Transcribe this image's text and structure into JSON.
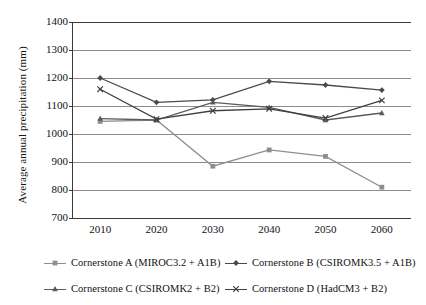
{
  "chart_data": {
    "type": "line",
    "title": "",
    "xlabel": "",
    "ylabel": "Average annual precipitation (mm)",
    "x": [
      2010,
      2020,
      2030,
      2040,
      2050,
      2060
    ],
    "categories": [
      "2010",
      "2020",
      "2030",
      "2040",
      "2050",
      "2060"
    ],
    "ylim": [
      700,
      1400
    ],
    "yticks": [
      700,
      800,
      900,
      1000,
      1100,
      1200,
      1300,
      1400
    ],
    "ytick_labels": [
      "700",
      "800",
      "900",
      "1000",
      "1100",
      "1200",
      "1300",
      "1400"
    ],
    "grid": true,
    "grid_axis": "y",
    "legend_position": "bottom",
    "legend_columns": 2,
    "series": [
      {
        "name": "Cornerstone A (MIROC3.2 + A1B)",
        "key": "A",
        "marker": "square",
        "color": "#8e8e8e",
        "values": [
          1045,
          1050,
          885,
          943,
          920,
          810
        ]
      },
      {
        "name": "Cornerstone B (CSIROMK3.5 + A1B)",
        "key": "B",
        "marker": "diamond",
        "color": "#4a4a4a",
        "values": [
          1200,
          1113,
          1122,
          1188,
          1175,
          1157
        ]
      },
      {
        "name": "Cornerstone C (CSIROMK2 + B2)",
        "key": "C",
        "marker": "triangle",
        "color": "#5a5a5a",
        "values": [
          1055,
          1050,
          1113,
          1095,
          1050,
          1075
        ]
      },
      {
        "name": "Cornerstone D (HadCM3 + B2)",
        "key": "D",
        "marker": "cross",
        "color": "#3f3f3f",
        "values": [
          1160,
          1053,
          1083,
          1090,
          1057,
          1120
        ]
      }
    ]
  },
  "legend": {
    "entries": [
      {
        "label": "Cornerstone A (MIROC3.2 + A1B)"
      },
      {
        "label": "Cornerstone B (CSIROMK3.5 + A1B)"
      },
      {
        "label": "Cornerstone C (CSIROMK2 + B2)"
      },
      {
        "label": "Cornerstone D (HadCM3 + B2)"
      }
    ]
  },
  "colors": {
    "axis": "#3a3a3a",
    "grid": "#8d8d8d",
    "text": "#111111",
    "background": "#ffffff"
  }
}
